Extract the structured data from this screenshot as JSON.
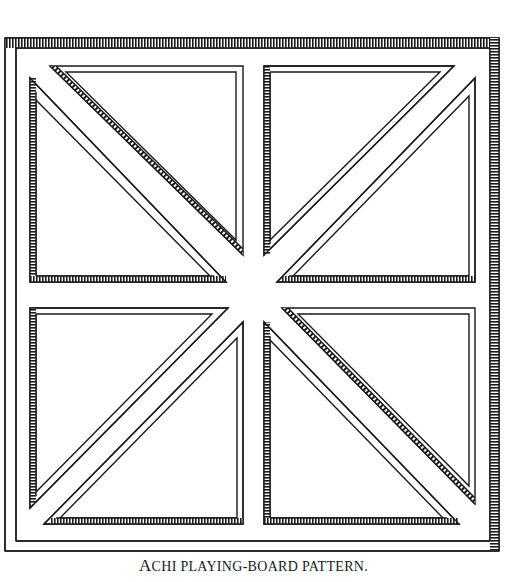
{
  "figure": {
    "title": "Achi playing-board pattern",
    "ink_color": "#1a1a1a",
    "paper_color": "#ffffff"
  },
  "caption": {
    "first_letter": "A",
    "rest": "CHI PLAYING-BOARD PATTERN."
  }
}
